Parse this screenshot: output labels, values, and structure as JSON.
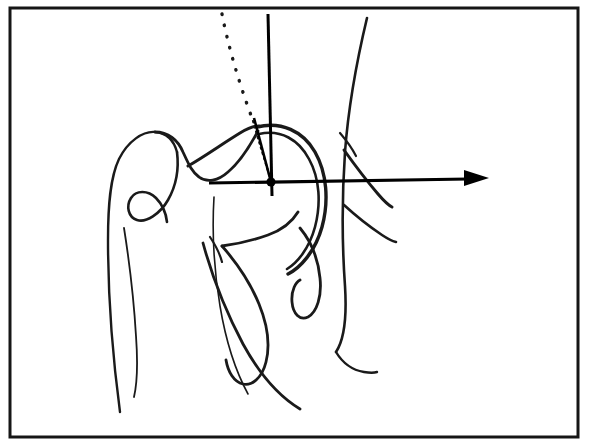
{
  "figure": {
    "kind": "anatomical-line-diagram",
    "caption": "",
    "canvas": {
      "width": 590,
      "height": 448
    },
    "colors": {
      "background": "#ffffff",
      "bone_outline": "#1a1a1a",
      "axis_line": "#000000",
      "frame": "#161616",
      "center_marker": "#000000"
    },
    "frame": {
      "x": 10,
      "y": 8,
      "width": 568,
      "height": 429,
      "stroke_width": 3
    },
    "labels": [],
    "annotations": {
      "center_point_label": "",
      "angle_label": "",
      "axis_label": ""
    }
  },
  "geometry": {
    "center_marker": {
      "cx": 271,
      "cy": 182,
      "r": 4.6
    },
    "horizontal_axis": {
      "name": "transverse-reference-axis",
      "x1": 209,
      "y1": 183,
      "x2": 468,
      "y2": 179,
      "stroke_width": 3.2,
      "arrow": {
        "tip_x": 489,
        "tip_y": 178,
        "back_x": 464,
        "half_height": 8
      }
    },
    "vertical_axis": {
      "name": "vertical-reference-axis",
      "x1": 268,
      "y1": 14,
      "x2": 272,
      "y2": 196,
      "stroke_width": 3.0
    },
    "neck_axis": {
      "name": "femoral-neck-axis",
      "x1": 271,
      "y1": 182,
      "x2": 254,
      "y2": 118,
      "stroke_width": 2.6
    },
    "dotted_axis": {
      "name": "dotted-reference-axis",
      "path": "M 222 14 C 228 45, 238 80, 252 118",
      "stroke_width": 3.4,
      "dash": "0.5 11"
    },
    "dotted_axis_lower": {
      "name": "dotted-axis-lower-segment",
      "path": "M 253 121 C 259 142, 266 164, 271 181",
      "stroke_width": 2.2,
      "dash": "1.5 4"
    },
    "paths": [
      {
        "name": "femur-greater-trochanter-outer",
        "d": "M 120 412 C 112 352, 108 288, 108 240 C 108 206, 110 178, 119 159 C 128 141, 143 131, 155 132 C 167 133, 174 141, 177 152",
        "stroke_width": 2.4
      },
      {
        "name": "femur-trochanter-crest",
        "d": "M 155 132 C 168 132, 178 140, 183 152 C 189 165, 192 172, 199 177 C 207 183, 218 181, 228 172 C 240 162, 250 146, 258 131",
        "stroke_width": 2.8
      },
      {
        "name": "trochanteric-fossa-hook",
        "d": "M 177 152 C 179 168, 176 186, 168 200 C 160 214, 146 223, 137 220 C 128 217, 126 206, 131 198 C 136 190, 148 190, 156 198 C 162 204, 166 213, 167 222",
        "stroke_width": 2.6
      },
      {
        "name": "femoral-head-outer-arc",
        "d": "M 257 127 C 281 121, 303 131, 315 152 C 327 173, 329 201, 322 227 C 315 252, 300 268, 288 274",
        "stroke_width": 3.4
      },
      {
        "name": "femoral-head-inner-arc",
        "d": "M 259 134 C 281 129, 299 140, 309 159 C 320 179, 321 204, 315 227 C 309 249, 297 263, 287 269",
        "stroke_width": 2.6
      },
      {
        "name": "femoral-neck-superior-border",
        "d": "M 188 166 C 204 157, 222 144, 240 133 C 248 128, 254 126, 259 126",
        "stroke_width": 3.0
      },
      {
        "name": "femoral-neck-inferior-border",
        "d": "M 222 246 C 238 244, 254 240, 268 235 C 282 230, 292 222, 298 212",
        "stroke_width": 2.8
      },
      {
        "name": "femur-shaft-medial-line",
        "d": "M 214 197 C 212 230, 214 270, 220 306 C 226 342, 236 372, 248 394",
        "stroke_width": 1.6
      },
      {
        "name": "femur-shaft-lateral-line",
        "d": "M 124 228 C 130 266, 134 302, 136 336 C 138 364, 137 384, 134 397",
        "stroke_width": 1.8
      },
      {
        "name": "lesser-trochanter-loop",
        "d": "M 222 246 C 236 262, 250 282, 259 304 C 268 326, 270 346, 266 362 C 262 378, 252 386, 243 384 C 234 382, 228 372, 226 360",
        "stroke_width": 2.8
      },
      {
        "name": "femur-proximal-shaft-sweep",
        "d": "M 203 243 C 212 276, 226 312, 243 344 C 260 375, 280 397, 300 409",
        "stroke_width": 2.8
      },
      {
        "name": "intertrochanteric-line",
        "d": "M 210 237 C 216 246, 220 254, 222 262",
        "stroke_width": 2.2
      },
      {
        "name": "acetabular-teardrop-loop",
        "d": "M 300 228 C 310 240, 318 258, 320 278 C 322 296, 317 312, 308 317 C 300 321, 293 314, 292 302 C 291 290, 296 282, 300 280",
        "stroke_width": 2.8
      },
      {
        "name": "pelvis-iliac-border",
        "d": "M 367 18 C 356 64, 348 112, 345 152 C 342 196, 342 244, 345 286 C 347 318, 344 340, 336 352",
        "stroke_width": 2.6
      },
      {
        "name": "pelvis-ischial-ramus",
        "d": "M 344 150 C 354 164, 366 180, 378 194 C 384 201, 388 205, 392 207",
        "stroke_width": 3.0
      },
      {
        "name": "pelvis-inferior-ramus",
        "d": "M 344 205 C 356 216, 370 227, 382 235 C 388 239, 392 241, 396 242",
        "stroke_width": 2.6
      },
      {
        "name": "pelvis-obturator-curve",
        "d": "M 336 352 C 342 362, 352 370, 364 372 C 370 373, 374 373, 377 372",
        "stroke_width": 2.4
      },
      {
        "name": "pelvis-superior-pubic-edge",
        "d": "M 340 133 C 346 140, 352 148, 356 156",
        "stroke_width": 2.2
      }
    ]
  }
}
